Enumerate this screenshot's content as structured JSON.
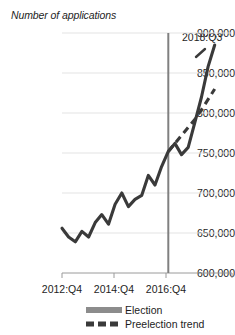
{
  "chart_data": {
    "type": "line",
    "title": "Number of applications",
    "xlabel": "",
    "ylabel": "Number of applications",
    "ylim": [
      600000,
      900000
    ],
    "yticks": [
      "600,000",
      "650,000",
      "700,000",
      "750,000",
      "800,000",
      "850,000",
      "900,000"
    ],
    "ytick_values": [
      600000,
      650000,
      700000,
      750000,
      800000,
      850000,
      900000
    ],
    "xticks": [
      "2012:Q4",
      "2014:Q4",
      "2016:Q4"
    ],
    "xtick_values": [
      "2012:Q4",
      "2014:Q4",
      "2016:Q4"
    ],
    "grid": true,
    "legend_position": "bottom",
    "annotations": [
      {
        "text": "2018:Q3",
        "x": "2018:Q3",
        "y": 885000
      }
    ],
    "marker_line": {
      "label": "election",
      "x": "2016:Q4",
      "color": "#808080"
    },
    "x": [
      "2012:Q4",
      "2013:Q1",
      "2013:Q2",
      "2013:Q3",
      "2013:Q4",
      "2014:Q1",
      "2014:Q2",
      "2014:Q3",
      "2014:Q4",
      "2015:Q1",
      "2015:Q2",
      "2015:Q3",
      "2015:Q4",
      "2016:Q1",
      "2016:Q2",
      "2016:Q3",
      "2016:Q4",
      "2017:Q1",
      "2017:Q2",
      "2017:Q3",
      "2017:Q4",
      "2018:Q1",
      "2018:Q2",
      "2018:Q3"
    ],
    "series": [
      {
        "name": "Election",
        "style": "solid",
        "color": "#3a3a3a",
        "values": [
          656000,
          645000,
          639000,
          652000,
          645000,
          663000,
          673000,
          661000,
          686000,
          700000,
          683000,
          692000,
          697000,
          722000,
          710000,
          733000,
          752000,
          762000,
          748000,
          757000,
          788000,
          820000,
          858000,
          885000
        ]
      },
      {
        "name": "Preelection trend",
        "style": "dashed",
        "color": "#3a3a3a",
        "values": [
          null,
          null,
          null,
          null,
          null,
          null,
          null,
          null,
          null,
          null,
          null,
          null,
          null,
          null,
          null,
          null,
          752000,
          762000,
          772000,
          782000,
          792000,
          804000,
          817000,
          830000
        ]
      }
    ],
    "legend": [
      {
        "label": "Election",
        "style": "solid"
      },
      {
        "label": "Preelection trend",
        "style": "dashed"
      }
    ]
  }
}
